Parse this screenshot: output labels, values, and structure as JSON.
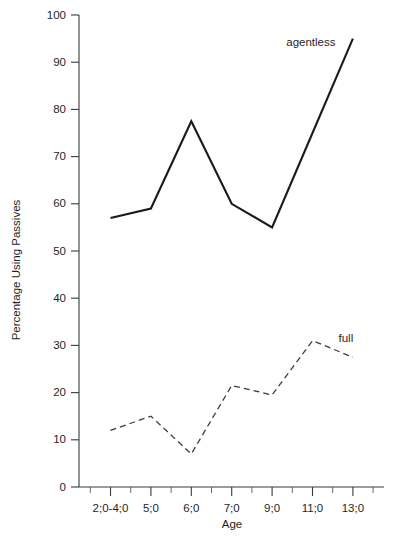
{
  "chart_data": {
    "type": "line",
    "title": "",
    "xlabel": "Age",
    "ylabel": "Percentage Using Passives",
    "categories": [
      "2;0-4;0",
      "5;0",
      "6;0",
      "7;0",
      "9;0",
      "11;0",
      "13;0"
    ],
    "xtick_labels": [
      "2;0-4;0",
      "5;0",
      "6;0",
      "7;0",
      "9;0",
      "11;0",
      "13;0"
    ],
    "ytick_labels": [
      "0",
      "10",
      "20",
      "30",
      "40",
      "50",
      "60",
      "70",
      "80",
      "90",
      "100"
    ],
    "ytick_values": [
      0,
      10,
      20,
      30,
      40,
      50,
      60,
      70,
      80,
      90,
      100
    ],
    "ylim": [
      0,
      100
    ],
    "grid": false,
    "legend_position": "inline-annotation",
    "minor_ticks_x": true,
    "series": [
      {
        "name": "agentless",
        "style": "solid",
        "color": "#1b1b1b",
        "values": [
          57,
          59,
          77.5,
          60,
          55,
          75,
          95
        ],
        "annotation": "agentless"
      },
      {
        "name": "full",
        "style": "dashed",
        "color": "#3d3d3d",
        "values": [
          12,
          15,
          7,
          21.5,
          19.5,
          31,
          27.5
        ],
        "annotation": "full"
      }
    ],
    "annotations": [
      {
        "text": "agentless",
        "series": "agentless"
      },
      {
        "text": "full",
        "series": "full"
      }
    ]
  },
  "colors": {
    "background": "#ffffff",
    "axis": "#3a3a3a",
    "text": "#1f1f1f",
    "agentless": "#1b1b1b",
    "full": "#3d3d3d"
  }
}
